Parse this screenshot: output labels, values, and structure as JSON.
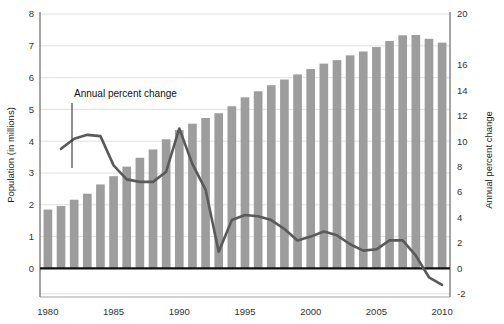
{
  "chart_data": {
    "type": "bar",
    "title": "",
    "subtitle": "",
    "xlabel": "",
    "ylabel": "Population (in millions)",
    "y2label": "Annual percent change",
    "grid": true,
    "legend_position": "none",
    "x": [
      1980,
      1981,
      1982,
      1983,
      1984,
      1985,
      1986,
      1987,
      1988,
      1989,
      1990,
      1991,
      1992,
      1993,
      1994,
      1995,
      1996,
      1997,
      1998,
      1999,
      2000,
      2001,
      2002,
      2003,
      2004,
      2005,
      2006,
      2007,
      2008,
      2009,
      2010
    ],
    "xlim": [
      1979.4,
      2010.6
    ],
    "xticks": [
      1980,
      1985,
      1990,
      1995,
      2000,
      2005,
      2010
    ],
    "xticklabels": [
      "1980",
      "1985",
      "1990",
      "1995",
      "2000",
      "2005",
      "2010"
    ],
    "ylim": [
      0,
      8
    ],
    "yticks": [
      0,
      1,
      2,
      3,
      4,
      5,
      6,
      7,
      8
    ],
    "yticklabels": [
      "0",
      "1",
      "2",
      "3",
      "4",
      "5",
      "6",
      "7",
      "8"
    ],
    "y2lim": [
      -2,
      20
    ],
    "y2ticks": [
      -2,
      0,
      2,
      4,
      6,
      8,
      10,
      12,
      14,
      16,
      18,
      20
    ],
    "y2ticklabels": [
      "-2",
      "0",
      "2",
      "4",
      "6",
      "8",
      "10",
      "12",
      "14",
      "16",
      "18",
      "20"
    ],
    "y2ticklabels_shown": [
      "-2",
      "0",
      "2",
      "4",
      "6",
      "8",
      "10",
      "12",
      "14",
      "16",
      "20"
    ],
    "series": [
      {
        "name": "Population (in millions)",
        "type": "bar",
        "axis": "left",
        "color": "#9d9d9d",
        "values": [
          1.85,
          1.96,
          2.16,
          2.35,
          2.64,
          2.9,
          3.2,
          3.48,
          3.74,
          4.06,
          4.35,
          4.55,
          4.73,
          4.88,
          5.1,
          5.38,
          5.57,
          5.76,
          5.94,
          6.1,
          6.27,
          6.44,
          6.55,
          6.7,
          6.82,
          6.96,
          7.15,
          7.33,
          7.34,
          7.22,
          7.1
        ]
      },
      {
        "name": "Annual percent change",
        "type": "line",
        "axis": "right",
        "color": "#5a5a5a",
        "x": [
          1981,
          1982,
          1983,
          1984,
          1985,
          1986,
          1987,
          1988,
          1989,
          1990,
          1991,
          1992,
          1993,
          1994,
          1995,
          1996,
          1997,
          1998,
          1999,
          2000,
          2001,
          2002,
          2003,
          2004,
          2005,
          2006,
          2007,
          2008,
          2009,
          2010
        ],
        "values": [
          9.4,
          10.2,
          10.5,
          10.4,
          8.1,
          7.0,
          6.8,
          6.8,
          7.6,
          11.0,
          8.2,
          6.2,
          1.3,
          3.8,
          4.2,
          4.1,
          3.8,
          3.1,
          2.2,
          2.5,
          2.9,
          2.6,
          1.9,
          1.4,
          1.5,
          2.2,
          2.2,
          1.0,
          -0.7,
          -1.3
        ]
      }
    ],
    "annotations": [
      {
        "text": "Annual percent change",
        "x_px": 74,
        "y_px": 97,
        "leader_from_px": [
          72,
          103
        ],
        "leader_to_px": [
          72,
          168
        ]
      }
    ]
  },
  "axes": {
    "left_title": "Population (in millions)",
    "right_title": "Annual percent change"
  }
}
